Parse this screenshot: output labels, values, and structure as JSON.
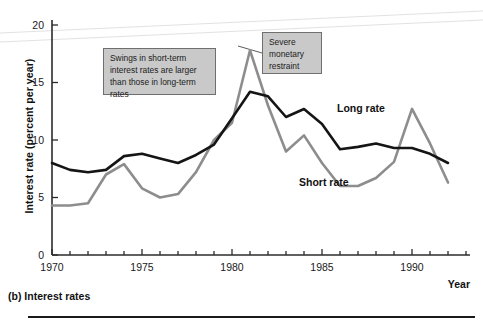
{
  "figure": {
    "caption": "(b) Interest rates",
    "x_axis_title": "Year",
    "y_axis_title": "Interest rate (percent per year)"
  },
  "annotations": [
    {
      "name": "swings-callout",
      "text": "Swings in short-term interest rates are larger than those in long-term rates"
    },
    {
      "name": "severe-callout",
      "text": "Severe monetary restraint"
    }
  ],
  "series_labels": {
    "long": "Long rate",
    "short": "Short rate"
  },
  "colors": {
    "long_rate": "#151515",
    "short_rate": "#8d8d8d",
    "callout_fill": "#c9c9c9",
    "callout_border": "#6f6f6f",
    "axis": "#2b2b2b"
  },
  "chart_data": {
    "type": "line",
    "title": "(b) Interest rates",
    "xlabel": "Year",
    "ylabel": "Interest rate (percent per year)",
    "xlim": [
      1970,
      1993
    ],
    "ylim": [
      0,
      20
    ],
    "ytick_labels": [
      "0",
      "5",
      "10",
      "15",
      "20"
    ],
    "yticks": [
      0,
      5,
      10,
      15,
      20
    ],
    "xtick_labels": [
      "1970",
      "1975",
      "1980",
      "1985",
      "1990"
    ],
    "xticks": [
      1970,
      1975,
      1980,
      1985,
      1990
    ],
    "xticks_minor": [
      1971,
      1972,
      1973,
      1974,
      1976,
      1977,
      1978,
      1979,
      1981,
      1982,
      1983,
      1984,
      1986,
      1987,
      1988,
      1989,
      1991,
      1992
    ],
    "grid": false,
    "legend": "inline-labels",
    "x": [
      1970,
      1971,
      1972,
      1973,
      1974,
      1975,
      1976,
      1977,
      1978,
      1979,
      1980,
      1981,
      1982,
      1983,
      1984,
      1985,
      1986,
      1987,
      1988,
      1989,
      1990,
      1991,
      1992
    ],
    "series": [
      {
        "name": "Long rate",
        "color": "#151515",
        "values": [
          8.0,
          7.4,
          7.2,
          7.4,
          8.6,
          8.8,
          8.4,
          8.0,
          8.7,
          9.6,
          11.9,
          14.2,
          13.8,
          12.0,
          12.7,
          11.4,
          9.2,
          9.4,
          9.7,
          9.3,
          9.3,
          8.8,
          8.0
        ]
      },
      {
        "name": "Short rate",
        "color": "#8d8d8d",
        "values": [
          4.3,
          4.3,
          4.5,
          7.0,
          7.9,
          5.8,
          5.0,
          5.3,
          7.2,
          10.0,
          11.5,
          17.8,
          13.0,
          9.0,
          10.4,
          8.0,
          6.0,
          6.0,
          6.7,
          8.1,
          12.7,
          9.7,
          6.3
        ]
      }
    ],
    "annotations": [
      {
        "text": "Swings in short-term interest rates are larger than those in long-term rates",
        "points_to": null
      },
      {
        "text": "Severe monetary restraint",
        "points_to": {
          "x": 1981,
          "y": 17.8
        }
      }
    ]
  }
}
